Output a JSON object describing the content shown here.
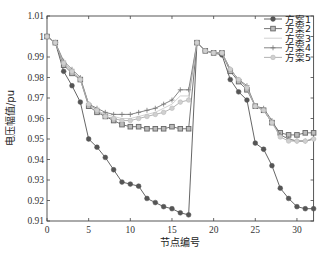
{
  "chart_data": {
    "type": "line",
    "title": "",
    "xlabel": "节点编号",
    "ylabel": "电压幅值/pu",
    "xlim": [
      0,
      32
    ],
    "ylim": [
      0.91,
      1.01
    ],
    "xticks": [
      0,
      5,
      10,
      15,
      20,
      25,
      30
    ],
    "yticks": [
      0.91,
      0.92,
      0.93,
      0.94,
      0.95,
      0.96,
      0.97,
      0.98,
      0.99,
      1,
      1.01
    ],
    "ytick_labels": [
      "0.91",
      "0.92",
      "0.93",
      "0.94",
      "0.95",
      "0.96",
      "0.97",
      "0.98",
      "0.99",
      "1",
      "1.01"
    ],
    "grid": false,
    "legend_position": "upper right",
    "x": [
      0,
      1,
      2,
      3,
      4,
      5,
      6,
      7,
      8,
      9,
      10,
      11,
      12,
      13,
      14,
      15,
      16,
      17,
      18,
      19,
      20,
      21,
      22,
      23,
      24,
      25,
      26,
      27,
      28,
      29,
      30,
      31,
      32
    ],
    "series": [
      {
        "name": "方案1",
        "color": "#555555",
        "marker": "circle",
        "values": [
          1.0,
          0.997,
          0.983,
          0.976,
          0.968,
          0.95,
          0.946,
          0.941,
          0.935,
          0.929,
          0.928,
          0.927,
          0.921,
          0.919,
          0.917,
          0.916,
          0.914,
          0.913,
          0.997,
          0.993,
          0.992,
          0.991,
          0.979,
          0.973,
          0.969,
          0.948,
          0.945,
          0.937,
          0.926,
          0.921,
          0.917,
          0.916,
          0.916
        ]
      },
      {
        "name": "方案2",
        "color": "#666666",
        "marker": "square",
        "values": [
          1.0,
          0.997,
          0.986,
          0.982,
          0.979,
          0.966,
          0.963,
          0.961,
          0.959,
          0.957,
          0.956,
          0.956,
          0.955,
          0.955,
          0.955,
          0.956,
          0.955,
          0.955,
          0.997,
          0.993,
          0.992,
          0.992,
          0.983,
          0.978,
          0.974,
          0.966,
          0.964,
          0.958,
          0.953,
          0.952,
          0.952,
          0.953,
          0.953
        ]
      },
      {
        "name": "方案3",
        "color": "#cccccc",
        "marker": "none",
        "values": [
          1.0,
          0.997,
          0.987,
          0.983,
          0.979,
          0.967,
          0.964,
          0.962,
          0.961,
          0.96,
          0.96,
          0.961,
          0.962,
          0.963,
          0.965,
          0.967,
          0.971,
          0.971,
          0.997,
          0.993,
          0.992,
          0.992,
          0.984,
          0.979,
          0.975,
          0.966,
          0.964,
          0.958,
          0.952,
          0.95,
          0.949,
          0.949,
          0.95
        ]
      },
      {
        "name": "方案4",
        "color": "#777777",
        "marker": "plus",
        "values": [
          1.0,
          0.997,
          0.988,
          0.984,
          0.98,
          0.967,
          0.965,
          0.963,
          0.962,
          0.962,
          0.962,
          0.963,
          0.964,
          0.965,
          0.967,
          0.969,
          0.974,
          0.974,
          0.997,
          0.993,
          0.992,
          0.992,
          0.984,
          0.979,
          0.976,
          0.966,
          0.965,
          0.959,
          0.952,
          0.95,
          0.949,
          0.949,
          0.95
        ]
      },
      {
        "name": "方案5",
        "color": "#aaaaaa",
        "marker": "diamond",
        "values": [
          1.0,
          0.997,
          0.987,
          0.983,
          0.979,
          0.967,
          0.964,
          0.961,
          0.96,
          0.959,
          0.959,
          0.96,
          0.961,
          0.962,
          0.963,
          0.965,
          0.968,
          0.969,
          0.997,
          0.993,
          0.992,
          0.992,
          0.984,
          0.979,
          0.975,
          0.966,
          0.964,
          0.958,
          0.951,
          0.949,
          0.949,
          0.949,
          0.95
        ]
      }
    ]
  },
  "legend": {
    "items": [
      "方案1",
      "方案2",
      "方案3",
      "方案4",
      "方案5"
    ]
  }
}
